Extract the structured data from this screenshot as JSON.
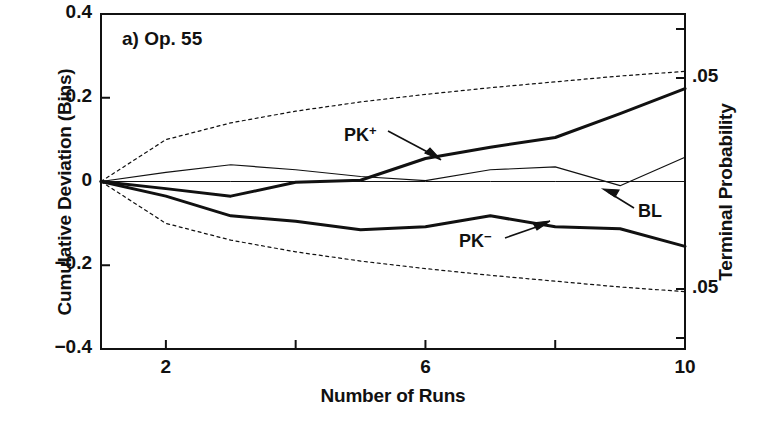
{
  "figure": {
    "panel_label": "a) Op. 55",
    "background_color": "#ffffff",
    "line_color": "#111111"
  },
  "axes": {
    "left": {
      "title": "Cumulative Deviation (Bins)",
      "ticks": [
        "0.4",
        "0.2",
        "0",
        "−0.2",
        "−0.4"
      ],
      "tick_values": [
        0.4,
        0.2,
        0,
        -0.2,
        -0.4
      ],
      "range": [
        -0.4,
        0.4
      ]
    },
    "right": {
      "title": "Terminal Probability",
      "ticks": [
        ".05",
        ".05"
      ],
      "tick_values": [
        0.05,
        0.05
      ]
    },
    "bottom": {
      "title": "Number of Runs",
      "ticks": [
        "2",
        "4",
        "6",
        "8",
        "10"
      ],
      "tick_values": [
        2,
        4,
        6,
        8,
        10
      ],
      "range": [
        1,
        10
      ]
    }
  },
  "series_labels": {
    "pk_plus": "PK",
    "pk_plus_sup": "+",
    "pk_minus": "PK",
    "pk_minus_sup": "−",
    "baseline": "BL"
  },
  "chart_data": {
    "type": "line",
    "title": "a) Op. 55",
    "xlabel": "Number of Runs",
    "ylabel": "Cumulative Deviation (Bins)",
    "y2label": "Terminal Probability",
    "xlim": [
      1,
      10
    ],
    "ylim": [
      -0.4,
      0.4
    ],
    "xticks": [
      2,
      4,
      6,
      8,
      10
    ],
    "yticks": [
      0.4,
      0.2,
      0,
      -0.2,
      -0.4
    ],
    "y2ticks": [
      0.05,
      0.05
    ],
    "grid": false,
    "legend": "inline-annotations",
    "x": [
      1,
      2,
      3,
      4,
      5,
      6,
      7,
      8,
      9,
      10
    ],
    "series": [
      {
        "name": "PK+",
        "style": "solid-thick",
        "linewidth": 3,
        "values": [
          0,
          -0.017,
          -0.035,
          -0.002,
          0.003,
          0.055,
          0.082,
          0.105,
          0.162,
          0.222
        ]
      },
      {
        "name": "PK-",
        "style": "solid-thick",
        "linewidth": 3,
        "values": [
          0,
          -0.035,
          -0.082,
          -0.095,
          -0.115,
          -0.108,
          -0.082,
          -0.108,
          -0.113,
          -0.155
        ]
      },
      {
        "name": "BL",
        "style": "solid-thin",
        "linewidth": 1.2,
        "values": [
          0,
          0.022,
          0.04,
          0.028,
          0.012,
          0.002,
          0.028,
          0.035,
          -0.01,
          0.058
        ]
      },
      {
        "name": "p=.05 upper envelope",
        "style": "dotted",
        "linewidth": 1.2,
        "values": [
          0,
          0.1,
          0.14,
          0.168,
          0.19,
          0.208,
          0.224,
          0.238,
          0.252,
          0.263
        ]
      },
      {
        "name": "p=.05 lower envelope",
        "style": "dotted",
        "linewidth": 1.2,
        "values": [
          0,
          -0.1,
          -0.14,
          -0.168,
          -0.19,
          -0.208,
          -0.224,
          -0.238,
          -0.252,
          -0.263
        ]
      },
      {
        "name": "zero reference",
        "style": "solid-hairline",
        "linewidth": 1,
        "values": [
          0,
          0,
          0,
          0,
          0,
          0,
          0,
          0,
          0,
          0
        ]
      }
    ],
    "annotations": [
      {
        "text": "PK+",
        "x": 5.0,
        "y": 0.138
      },
      {
        "text": "PK−",
        "x": 6.6,
        "y": -0.115
      },
      {
        "text": "BL",
        "x": 9.3,
        "y": -0.05
      }
    ]
  }
}
